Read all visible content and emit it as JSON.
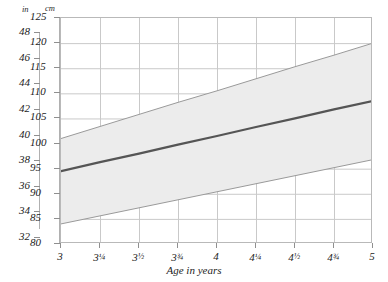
{
  "title": "",
  "axes": {
    "left_unit_label": "in",
    "right_unit_label": "cm",
    "x_title": "Age in years",
    "cm_ticks": [
      125,
      120,
      115,
      110,
      105,
      100,
      95,
      90,
      85,
      80
    ],
    "in_ticks": [
      48,
      46,
      44,
      42,
      40,
      38,
      36,
      34,
      32
    ],
    "x_ticks": [
      {
        "value": 3,
        "whole": "3",
        "frac": ""
      },
      {
        "value": 3.25,
        "whole": "3",
        "frac": "¼"
      },
      {
        "value": 3.5,
        "whole": "3",
        "frac": "½"
      },
      {
        "value": 3.75,
        "whole": "3",
        "frac": "¾"
      },
      {
        "value": 4,
        "whole": "4",
        "frac": ""
      },
      {
        "value": 4.25,
        "whole": "4",
        "frac": "¼"
      },
      {
        "value": 4.5,
        "whole": "4",
        "frac": "½"
      },
      {
        "value": 4.75,
        "whole": "4",
        "frac": "¾"
      },
      {
        "value": 5,
        "whole": "5",
        "frac": ""
      }
    ]
  },
  "colors": {
    "band_fill": "#ececec",
    "band_edge": "#9a9a9a",
    "median_line": "#555555",
    "grid": "#c9c9c9",
    "frame": "#b9b9b9",
    "text": "#1c1c1c"
  },
  "chart_data": {
    "type": "line",
    "title": "",
    "xlabel": "Age in years",
    "ylabel": "Height (cm)",
    "xlim": [
      3,
      5
    ],
    "ylim": [
      80,
      125
    ],
    "y2label": "Height (in)",
    "y2lim": [
      32,
      48
    ],
    "grid": true,
    "legend": "none",
    "x": [
      3,
      3.25,
      3.5,
      3.75,
      4,
      4.25,
      4.5,
      4.75,
      5
    ],
    "series": [
      {
        "name": "Upper reference limit",
        "style": "thin-line",
        "values": [
          101.0,
          103.4,
          105.8,
          108.2,
          110.5,
          112.9,
          115.3,
          117.6,
          120.0
        ]
      },
      {
        "name": "Median height",
        "style": "thick-line",
        "values": [
          94.5,
          96.3,
          98.0,
          99.8,
          101.5,
          103.3,
          105.0,
          106.8,
          108.5
        ]
      },
      {
        "name": "Lower reference limit",
        "style": "thin-line",
        "values": [
          84.0,
          85.6,
          87.2,
          88.8,
          90.4,
          92.0,
          93.6,
          95.2,
          96.8
        ]
      }
    ],
    "shaded_band": {
      "between": [
        "Lower reference limit",
        "Upper reference limit"
      ],
      "fill": "#ececec"
    }
  }
}
